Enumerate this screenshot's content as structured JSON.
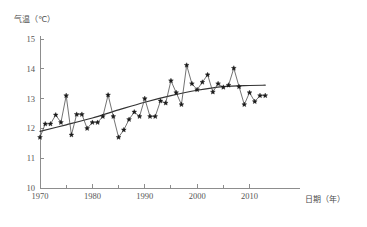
{
  "chart_data": {
    "type": "line",
    "title": "",
    "subtitle": "",
    "ylabel": "气温（℃）",
    "xlabel": "日期（年）",
    "xlim": [
      1969,
      2014
    ],
    "ylim": [
      10,
      15
    ],
    "grid": false,
    "legend": "none",
    "y_ticks": [
      "15",
      "14",
      "13",
      "12",
      "11",
      "10"
    ],
    "y_tick_values": [
      15,
      14,
      13,
      12,
      11,
      10
    ],
    "x_ticks": [
      "1970",
      "1980",
      "1990",
      "2000",
      "2010"
    ],
    "x_tick_values": [
      1970,
      1980,
      1990,
      2000,
      2010
    ],
    "x_minor_tick_values": [
      1975,
      1985,
      1995,
      2005
    ],
    "x": [
      1970,
      1971,
      1972,
      1973,
      1974,
      1975,
      1976,
      1977,
      1978,
      1979,
      1980,
      1981,
      1982,
      1983,
      1984,
      1985,
      1986,
      1987,
      1988,
      1989,
      1990,
      1991,
      1992,
      1993,
      1994,
      1995,
      1996,
      1997,
      1998,
      1999,
      2000,
      2001,
      2002,
      2003,
      2004,
      2005,
      2006,
      2007,
      2008,
      2009,
      2010,
      2011,
      2012,
      2013
    ],
    "series": [
      {
        "name": "年平均气温",
        "marker": "filled-star",
        "values": [
          11.7,
          12.15,
          12.15,
          12.45,
          12.2,
          13.1,
          11.78,
          12.47,
          12.47,
          12.0,
          12.2,
          12.2,
          12.4,
          13.12,
          12.4,
          11.7,
          11.95,
          12.3,
          12.55,
          12.4,
          13.0,
          12.4,
          12.4,
          12.92,
          12.85,
          13.6,
          13.2,
          12.8,
          14.12,
          13.5,
          13.3,
          13.55,
          13.8,
          13.22,
          13.5,
          13.38,
          13.45,
          14.02,
          13.4,
          12.8,
          13.2,
          12.9,
          13.1,
          13.1
        ]
      },
      {
        "name": "趋势线",
        "type": "trend",
        "x": [
          1970,
          1975,
          1980,
          1985,
          1990,
          1995,
          2000,
          2005,
          2010,
          2013
        ],
        "values": [
          11.9,
          12.12,
          12.35,
          12.62,
          12.88,
          13.1,
          13.28,
          13.4,
          13.44,
          13.45
        ]
      }
    ],
    "annotations": []
  }
}
